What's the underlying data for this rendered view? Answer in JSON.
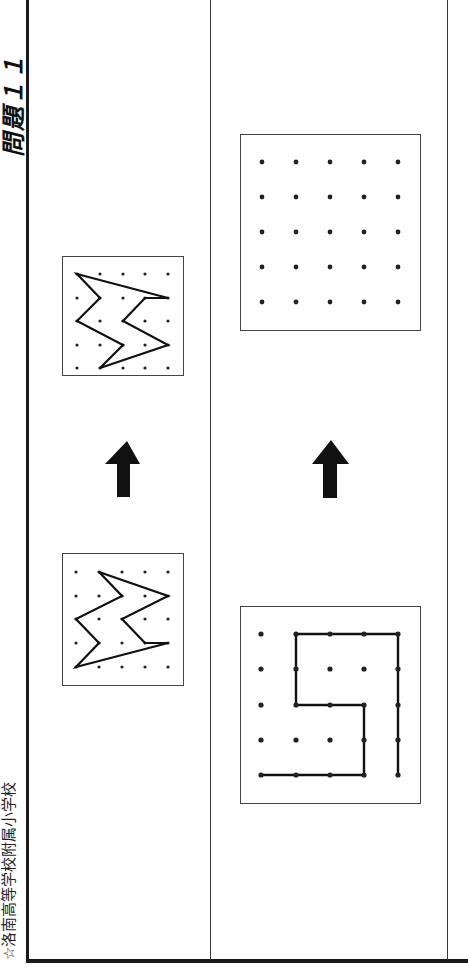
{
  "header": {
    "title": "問題１１",
    "school": "☆洛南高等学校附属小学校"
  },
  "colors": {
    "ink": "#1a1a1a",
    "paper": "#ffffff",
    "frame": "#3a3a3a"
  },
  "columns": [
    {
      "name": "example",
      "original_grid": {
        "size": "5x5",
        "shape_vertices": [
          [
            1,
            0
          ],
          [
            2,
            1
          ],
          [
            0,
            2
          ],
          [
            1,
            3
          ],
          [
            0,
            4
          ],
          [
            4,
            3
          ],
          [
            3,
            3
          ],
          [
            2,
            2
          ],
          [
            4,
            1
          ]
        ]
      },
      "arrow": "up-arrow",
      "result_grid": {
        "size": "5x5",
        "shape_vertices": [
          [
            0,
            0
          ],
          [
            1,
            1
          ],
          [
            0,
            2
          ],
          [
            2,
            3
          ],
          [
            1,
            4
          ],
          [
            4,
            3
          ],
          [
            2,
            2
          ],
          [
            3,
            1
          ],
          [
            4,
            1
          ]
        ]
      }
    },
    {
      "name": "question",
      "original_grid": {
        "size": "5x5",
        "path_vertices": [
          [
            0,
            4
          ],
          [
            3,
            4
          ],
          [
            3,
            2
          ],
          [
            1,
            2
          ],
          [
            1,
            0
          ],
          [
            4,
            0
          ],
          [
            4,
            4
          ]
        ]
      },
      "arrow": "up-arrow",
      "answer_grid": {
        "size": "5x5",
        "state": "empty"
      }
    }
  ]
}
